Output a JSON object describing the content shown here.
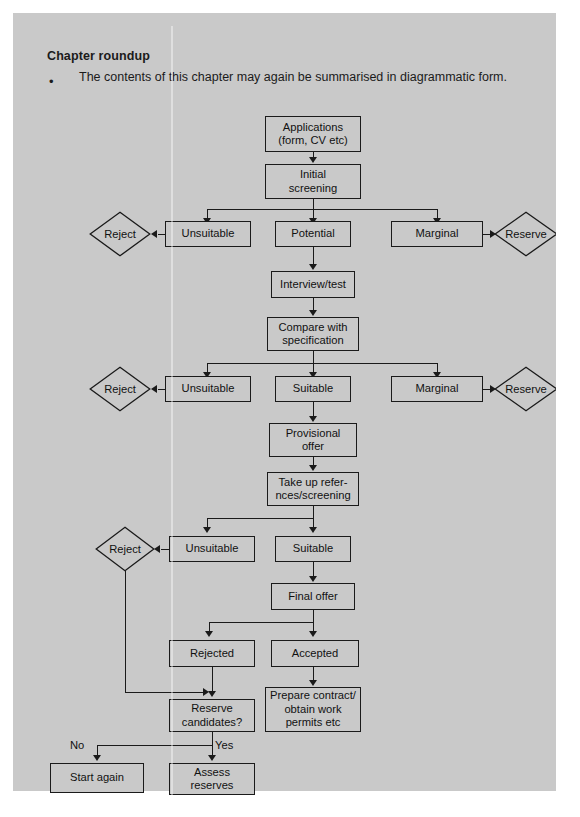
{
  "section": {
    "heading": "Chapter roundup",
    "bullet_marker": "•",
    "bullet_text": "The contents of this chapter may again be summarised in diagrammatic form."
  },
  "colors": {
    "panel_background": "#c9c9c9",
    "page_background": "#ffffff",
    "stroke": "#1a1a1a",
    "text": "#111111"
  },
  "diagram": {
    "nodes": {
      "applications": "Applications\n(form, CV etc)",
      "initial_screening": "Initial\nscreening",
      "unsuitable_1": "Unsuitable",
      "potential": "Potential",
      "marginal_1": "Marginal",
      "reject_1": "Reject",
      "reserve_1": "Reserve",
      "interview_test": "Interview/test",
      "compare_with_specification": "Compare with\nspecification",
      "unsuitable_2": "Unsuitable",
      "suitable_1": "Suitable",
      "marginal_2": "Marginal",
      "reject_2": "Reject",
      "reserve_2": "Reserve",
      "provisional_offer": "Provisional\noffer",
      "take_up_references": "Take up refer-\nnces/screening",
      "unsuitable_3": "Unsuitable",
      "suitable_2": "Suitable",
      "reject_3": "Reject",
      "final_offer": "Final offer",
      "rejected": "Rejected",
      "accepted": "Accepted",
      "reserve_candidates": "Reserve\ncandidates?",
      "prepare_contract": "Prepare contract/\nobtain work\npermits etc",
      "start_again": "Start again",
      "assess_reserves": "Assess\nreserves"
    },
    "edge_labels": {
      "no": "No",
      "yes": "Yes"
    }
  }
}
